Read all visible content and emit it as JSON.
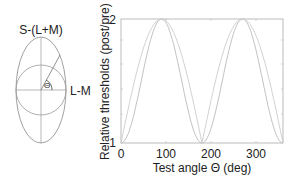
{
  "diagram": {
    "top_label": "S-(L+M)",
    "right_label": "L-M",
    "angle_label": "Θ"
  },
  "chart_data": {
    "type": "line",
    "title": "",
    "xlabel": "Test angle Θ (deg)",
    "ylabel": "Relative thresholds (post/pre)",
    "xlim": [
      0,
      360
    ],
    "ylim": [
      1,
      2
    ],
    "x_ticks": [
      "0",
      "100",
      "200",
      "300"
    ],
    "y_ticks": [
      "1",
      "2"
    ],
    "grid": false,
    "legend": null,
    "series": [
      {
        "name": "curve-1",
        "x": [
          0,
          45,
          90,
          135,
          180,
          225,
          270,
          315,
          360
        ],
        "values": [
          1.0,
          1.5,
          2.0,
          1.5,
          1.0,
          1.5,
          2.0,
          1.5,
          1.0
        ]
      },
      {
        "name": "curve-2",
        "x": [
          0,
          45,
          90,
          135,
          180,
          225,
          270,
          315,
          360
        ],
        "values": [
          1.0,
          1.7,
          2.0,
          1.7,
          1.0,
          1.7,
          2.0,
          1.7,
          1.0
        ]
      }
    ]
  }
}
